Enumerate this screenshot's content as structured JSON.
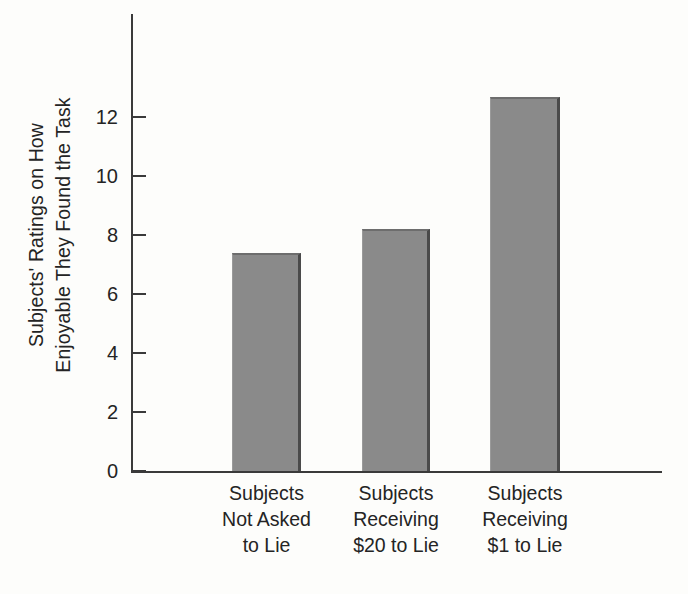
{
  "chart_data": {
    "type": "bar",
    "title": "",
    "xlabel": "",
    "ylabel": "Subjects' Ratings on How Enjoyable They Found the Task",
    "ylabel_lines": [
      "Subjects' Ratings on How",
      "Enjoyable They Found the Task"
    ],
    "categories": [
      "Subjects Not Asked to Lie",
      "Subjects Receiving $20 to Lie",
      "Subjects Receiving $1 to Lie"
    ],
    "category_lines": [
      [
        "Subjects",
        "Not Asked",
        "to Lie"
      ],
      [
        "Subjects",
        "Receiving",
        "$20 to Lie"
      ],
      [
        "Subjects",
        "Receiving",
        "$1 to Lie"
      ]
    ],
    "values": [
      7.4,
      8.2,
      12.7
    ],
    "ylim": [
      0,
      15.5
    ],
    "yticks": [
      0,
      2,
      4,
      6,
      8,
      10,
      12
    ],
    "ytick_labels": [
      "0",
      "2",
      "4",
      "6",
      "8",
      "10",
      "12"
    ],
    "grid": false,
    "legend": "none",
    "bar_color": "#8a8a8a",
    "bar_edge_color": "#4a4a4a",
    "axis_color": "#3a3a3a",
    "background_color": "#fdfdfb"
  }
}
